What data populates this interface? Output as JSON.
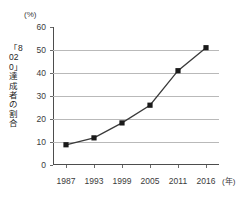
{
  "chart_data": {
    "type": "line",
    "title": "",
    "subtitle": "",
    "xlabel": "(年)",
    "ylabel": "「8020」達成者の割合",
    "y_unit": "(%)",
    "x_unit": "(年)",
    "categories": [
      "1987",
      "1993",
      "1999",
      "2005",
      "2011",
      "2016"
    ],
    "values": [
      8.8,
      11.8,
      18.3,
      26.0,
      41.0,
      51.0
    ],
    "series": [
      {
        "name": "「8020」達成者の割合",
        "values": [
          8.8,
          11.8,
          18.3,
          26.0,
          41.0,
          51.0
        ]
      }
    ],
    "yticks": [
      0,
      10,
      20,
      30,
      40,
      50,
      60
    ],
    "ytick_labels": [
      "0",
      "10",
      "20",
      "30",
      "40",
      "50",
      "60"
    ],
    "ylim": [
      0,
      60
    ],
    "grid": "horizontal",
    "legend": "none",
    "marker": "square",
    "line_color": "#3a3a3a",
    "marker_color": "#1a1a1a",
    "grid_color": "#b9b9b9",
    "axis_color": "#4d4d4d",
    "annotations": []
  },
  "axes": {
    "y_unit_label": "(%)",
    "y_title_label": "「8020」達成者の割合",
    "x_unit_label": "(年)"
  }
}
